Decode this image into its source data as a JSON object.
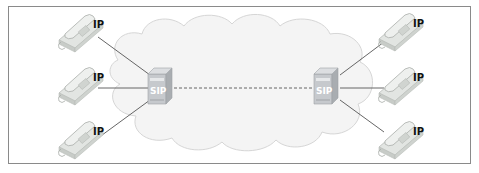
{
  "diagram": {
    "type": "network",
    "cloud": {
      "label": ""
    },
    "servers": [
      {
        "id": "left-sip-server",
        "label": "SIP"
      },
      {
        "id": "right-sip-server",
        "label": "SIP"
      }
    ],
    "phones": [
      {
        "id": "left-phone-1",
        "label": "IP"
      },
      {
        "id": "left-phone-2",
        "label": "IP"
      },
      {
        "id": "left-phone-3",
        "label": "IP"
      },
      {
        "id": "right-phone-1",
        "label": "IP"
      },
      {
        "id": "right-phone-2",
        "label": "IP"
      },
      {
        "id": "right-phone-3",
        "label": "IP"
      }
    ],
    "links": [
      {
        "from": "left-phone-1",
        "to": "left-sip-server",
        "style": "solid"
      },
      {
        "from": "left-phone-2",
        "to": "left-sip-server",
        "style": "solid"
      },
      {
        "from": "left-phone-3",
        "to": "left-sip-server",
        "style": "solid"
      },
      {
        "from": "left-sip-server",
        "to": "right-sip-server",
        "style": "dashed"
      },
      {
        "from": "right-sip-server",
        "to": "right-phone-1",
        "style": "solid"
      },
      {
        "from": "right-sip-server",
        "to": "right-phone-2",
        "style": "solid"
      },
      {
        "from": "right-sip-server",
        "to": "right-phone-3",
        "style": "solid"
      }
    ],
    "colors": {
      "cloud_fill": "#f4f4f4",
      "cloud_stroke": "#d6d6d6",
      "line": "#555555",
      "phone": "#d9dcd9",
      "server": "#c9cbcf"
    }
  }
}
